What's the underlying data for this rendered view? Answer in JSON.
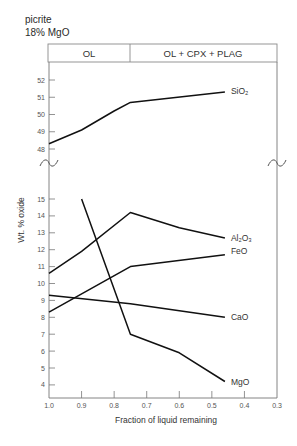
{
  "annotation": {
    "sample": "picrite",
    "composition": "18% MgO"
  },
  "chart_data": {
    "type": "line",
    "title": "",
    "xlabel": "Fraction of liquid remaining",
    "ylabel": "Wt. % oxide",
    "xlim": [
      1.0,
      0.3
    ],
    "x_ticks": [
      "1.0",
      "0.9",
      "0.8",
      "0.7",
      "0.6",
      "0.5",
      "0.4",
      "0.3"
    ],
    "y_axis_broken": true,
    "y_ticks_upper": [
      "48",
      "49",
      "50",
      "51",
      "52"
    ],
    "y_ticks_lower": [
      "4",
      "5",
      "6",
      "7",
      "8",
      "9",
      "10",
      "11",
      "12",
      "13",
      "14",
      "15"
    ],
    "grid": false,
    "legend": "inline labels at line ends",
    "phase_fields": [
      {
        "label": "OL",
        "from": 1.0,
        "to": 0.75
      },
      {
        "label": "OL + CPX + PLAG",
        "from": 0.75,
        "to": 0.3
      }
    ],
    "series": [
      {
        "name": "SiO₂",
        "panel": "upper",
        "x": [
          1.0,
          0.9,
          0.8,
          0.75,
          0.46
        ],
        "y": [
          48.3,
          49.1,
          50.2,
          50.7,
          51.3
        ]
      },
      {
        "name": "Al₂O₃",
        "panel": "lower",
        "x": [
          1.0,
          0.9,
          0.75,
          0.6,
          0.46
        ],
        "y": [
          10.6,
          11.9,
          14.2,
          13.3,
          12.7
        ]
      },
      {
        "name": "FeO",
        "panel": "lower",
        "x": [
          1.0,
          0.75,
          0.46
        ],
        "y": [
          8.3,
          11.0,
          11.7
        ]
      },
      {
        "name": "CaO",
        "panel": "lower",
        "x": [
          1.0,
          0.75,
          0.46
        ],
        "y": [
          9.3,
          8.8,
          8.0
        ]
      },
      {
        "name": "MgO",
        "panel": "lower",
        "x": [
          0.9,
          0.75,
          0.6,
          0.46
        ],
        "y": [
          15.0,
          7.0,
          5.9,
          4.2
        ]
      }
    ]
  }
}
